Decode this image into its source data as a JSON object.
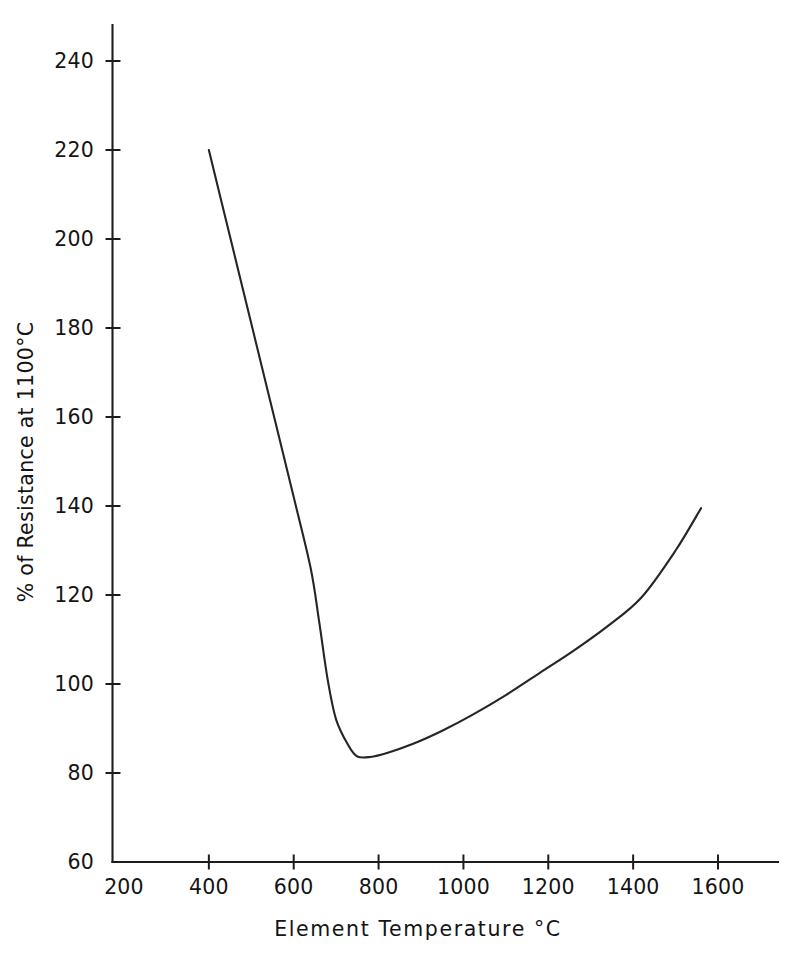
{
  "chart_data": {
    "type": "line",
    "title": "",
    "subtitle": "",
    "xlabel": "Element Temperature °C",
    "ylabel": "% of Resistance at 1100°C",
    "xlim": [
      200,
      1740
    ],
    "ylim": [
      60,
      244
    ],
    "xticks": [
      200,
      400,
      600,
      800,
      1000,
      1200,
      1400,
      1600
    ],
    "yticks": [
      60,
      80,
      100,
      120,
      140,
      160,
      180,
      200,
      220,
      240
    ],
    "xtick_labels": [
      "200",
      "400",
      "600",
      "800",
      "1000",
      "1200",
      "1400",
      "1600"
    ],
    "ytick_labels": [
      "60",
      "80",
      "100",
      "120",
      "140",
      "160",
      "180",
      "200",
      "220",
      "240"
    ],
    "grid": false,
    "legend": null,
    "legend_position": "none",
    "line_color": "#252525",
    "series": [
      {
        "name": "Resistance vs Element Temperature",
        "x": [
          400,
          450,
          500,
          550,
          600,
          640,
          660,
          680,
          700,
          730,
          750,
          780,
          820,
          880,
          950,
          1020,
          1100,
          1180,
          1260,
          1340,
          1420,
          1500,
          1560
        ],
        "y": [
          220.0,
          200.5,
          181.0,
          161.5,
          142.0,
          126.0,
          114.0,
          101.0,
          92.0,
          86.0,
          83.7,
          83.6,
          84.5,
          86.5,
          89.5,
          93.0,
          97.5,
          102.5,
          107.5,
          113.0,
          119.5,
          130.0,
          139.5
        ]
      }
    ],
    "annotations": [
      {
        "text": "minimum resistance",
        "x": 760,
        "y": 83.6
      },
      {
        "text": "curve start",
        "x": 400,
        "y": 220.0
      },
      {
        "text": "curve end",
        "x": 1560,
        "y": 139.5
      }
    ]
  },
  "axes": {
    "x_title": "Element Temperature °C",
    "y_title": "% of Resistance at 1100°C"
  }
}
